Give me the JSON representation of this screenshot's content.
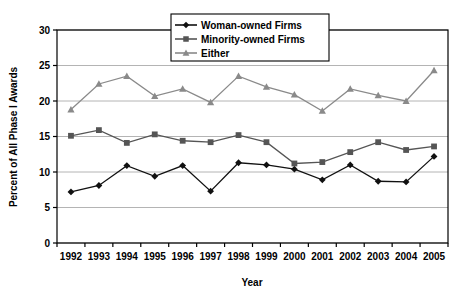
{
  "chart_data": {
    "type": "line",
    "title": "",
    "xlabel": "Year",
    "ylabel": "Percent of All Phase I Awards",
    "categories": [
      1992,
      1993,
      1994,
      1995,
      1996,
      1997,
      1998,
      1999,
      2000,
      2001,
      2002,
      2003,
      2004,
      2005
    ],
    "xtick_labels": [
      "1992",
      "1993",
      "1994",
      "1995",
      "1996",
      "1997",
      "1998",
      "1999",
      "2000",
      "2001",
      "2002",
      "2003",
      "2004",
      "2005"
    ],
    "ytick_labels": [
      "0",
      "5",
      "10",
      "15",
      "20",
      "25",
      "30"
    ],
    "yticks": [
      0,
      5,
      10,
      15,
      20,
      25,
      30
    ],
    "ylim": [
      0,
      30
    ],
    "grid": true,
    "legend_position": "top-center",
    "series": [
      {
        "name": "Woman-owned Firms",
        "marker": "diamond",
        "color": "#111111",
        "values": [
          7.2,
          8.1,
          10.9,
          9.4,
          10.9,
          7.3,
          11.3,
          11.0,
          10.4,
          8.9,
          11.0,
          8.7,
          8.6,
          12.2
        ]
      },
      {
        "name": "Minority-owned Firms",
        "marker": "square",
        "color": "#555555",
        "values": [
          15.1,
          15.9,
          14.1,
          15.3,
          14.4,
          14.2,
          15.2,
          14.2,
          11.2,
          11.4,
          12.8,
          14.2,
          13.1,
          13.6
        ]
      },
      {
        "name": "Either",
        "marker": "triangle",
        "color": "#8a8a8a",
        "values": [
          18.8,
          22.4,
          23.5,
          20.7,
          21.7,
          19.8,
          23.5,
          22.0,
          20.9,
          18.6,
          21.7,
          20.8,
          20.0,
          24.3
        ]
      }
    ]
  },
  "legend": {
    "entries": [
      "Woman-owned Firms",
      "Minority-owned Firms",
      "Either"
    ]
  }
}
